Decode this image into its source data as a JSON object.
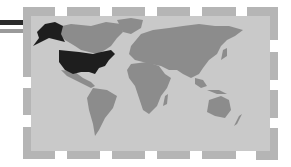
{
  "illustration": {
    "subject": "world map with United States highlighted",
    "highlighted_region": "United States (including Alaska)",
    "colors": {
      "background": "#ffffff",
      "panel": "#c9c9c9",
      "land": "#8c8c8c",
      "highlight": "#1e1e1e",
      "tile": "#b5b5b5",
      "stripe_dark": "#2a2a2a",
      "stripe_light": "#9a9a9a"
    }
  }
}
